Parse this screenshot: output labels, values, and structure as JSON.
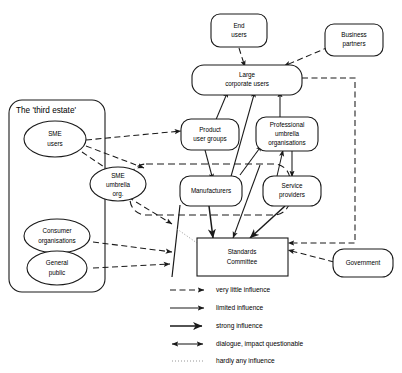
{
  "diagram": {
    "type": "influence-network",
    "nodes": [
      {
        "id": "end-users",
        "label_lines": [
          "End",
          "users"
        ],
        "shape": "rounded-rect"
      },
      {
        "id": "business-partners",
        "label_lines": [
          "Business",
          "partners"
        ],
        "shape": "rounded-rect"
      },
      {
        "id": "large-corporate-users",
        "label_lines": [
          "Large",
          "corporate users"
        ],
        "shape": "rounded-rect"
      },
      {
        "id": "product-user-groups",
        "label_lines": [
          "Product",
          "user groups"
        ],
        "shape": "rounded-rect"
      },
      {
        "id": "professional-umbrella-organisations",
        "label_lines": [
          "Professional",
          "umbrella",
          "organisations"
        ],
        "shape": "rounded-rect"
      },
      {
        "id": "manufacturers",
        "label_lines": [
          "Manufacturers"
        ],
        "shape": "rounded-rect"
      },
      {
        "id": "service-providers",
        "label_lines": [
          "Service",
          "providers"
        ],
        "shape": "rounded-rect"
      },
      {
        "id": "sme-users",
        "label_lines": [
          "SME",
          "users"
        ],
        "shape": "ellipse"
      },
      {
        "id": "sme-umbrella-org",
        "label_lines": [
          "SME",
          "umbrella",
          "org."
        ],
        "shape": "ellipse"
      },
      {
        "id": "consumer-organisations",
        "label_lines": [
          "Consumer",
          "organisations"
        ],
        "shape": "ellipse"
      },
      {
        "id": "general-public",
        "label_lines": [
          "General",
          "public"
        ],
        "shape": "ellipse"
      },
      {
        "id": "standards-committee",
        "label_lines": [
          "Standards",
          "Committee"
        ],
        "shape": "rect"
      },
      {
        "id": "government",
        "label_lines": [
          "Government"
        ],
        "shape": "rounded-rect"
      }
    ],
    "groups": [
      {
        "id": "third-estate",
        "label": "The 'third estate'",
        "style": "solid"
      },
      {
        "id": "industry-cluster",
        "label": "",
        "style": "dashed"
      }
    ],
    "labels": {
      "end_users_l1": "End",
      "end_users_l2": "users",
      "business_partners_l1": "Business",
      "business_partners_l2": "partners",
      "large_corporate_l1": "Large",
      "large_corporate_l2": "corporate users",
      "product_user_groups_l1": "Product",
      "product_user_groups_l2": "user groups",
      "professional_l1": "Professional",
      "professional_l2": "umbrella",
      "professional_l3": "organisations",
      "manufacturers_l1": "Manufacturers",
      "service_providers_l1": "Service",
      "service_providers_l2": "providers",
      "sme_users_l1": "SME",
      "sme_users_l2": "users",
      "sme_umbrella_l1": "SME",
      "sme_umbrella_l2": "umbrella",
      "sme_umbrella_l3": "org.",
      "consumer_org_l1": "Consumer",
      "consumer_org_l2": "organisations",
      "general_public_l1": "General",
      "general_public_l2": "public",
      "standards_committee_l1": "Standards",
      "standards_committee_l2": "Committee",
      "government_l1": "Government",
      "third_estate_group": "The 'third estate'"
    }
  },
  "legend": {
    "items": [
      {
        "id": "very-little",
        "label": "very little influence",
        "style": "dashed-arrow"
      },
      {
        "id": "limited",
        "label": "limited influence",
        "style": "thin-arrow"
      },
      {
        "id": "strong",
        "label": "strong influence",
        "style": "thick-arrow"
      },
      {
        "id": "dialogue",
        "label": "dialogue, impact questionable",
        "style": "double-arrow"
      },
      {
        "id": "hardly-any",
        "label": "hardly any influence",
        "style": "dotted"
      }
    ]
  },
  "colors": {
    "stroke": "#1a1a1a",
    "background": "#ffffff",
    "dotted": "#8a8a8a"
  }
}
